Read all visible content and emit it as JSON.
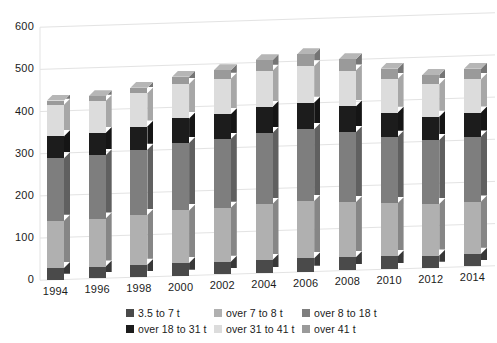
{
  "chart_data": {
    "type": "bar",
    "subtype": "stacked-bar-3d",
    "title": "",
    "subtitle": "",
    "xlabel": "",
    "ylabel": "",
    "ylim": [
      0,
      600
    ],
    "yticks": [
      0,
      100,
      200,
      300,
      400,
      500,
      600
    ],
    "grid": true,
    "legend_position": "bottom",
    "categories": [
      "1994",
      "1996",
      "1998",
      "2000",
      "2002",
      "2004",
      "2006",
      "2008",
      "2010",
      "2012",
      "2014"
    ],
    "series": [
      {
        "name": "3.5 to 7 t",
        "color": "#4a4a4a",
        "values": [
          28,
          28,
          29,
          30,
          30,
          31,
          32,
          31,
          30,
          29,
          30
        ]
      },
      {
        "name": "over 7 to 8 t",
        "color": "#b0b0b0",
        "values": [
          112,
          114,
          118,
          125,
          128,
          133,
          136,
          131,
          126,
          122,
          124
        ]
      },
      {
        "name": "over 8 to 18 t",
        "color": "#7e7e7e",
        "values": [
          148,
          150,
          155,
          160,
          163,
          168,
          170,
          166,
          158,
          152,
          154
        ]
      },
      {
        "name": "over 18 to 31 t",
        "color": "#1c1c1c",
        "values": [
          52,
          53,
          55,
          58,
          59,
          62,
          63,
          61,
          57,
          55,
          57
        ]
      },
      {
        "name": "over 31 to 41 t",
        "color": "#dcdcdc",
        "values": [
          75,
          76,
          79,
          82,
          84,
          86,
          87,
          85,
          80,
          77,
          79
        ]
      },
      {
        "name": "over 41 t",
        "color": "#9a9a9a",
        "values": [
          10,
          11,
          13,
          17,
          20,
          25,
          28,
          27,
          24,
          22,
          25
        ]
      }
    ],
    "totals": [
      425,
      432,
      449,
      472,
      484,
      505,
      516,
      501,
      475,
      457,
      469
    ]
  },
  "axes": {
    "y_tick_labels": [
      "600",
      "500",
      "400",
      "300",
      "200",
      "100",
      "0"
    ],
    "x_tick_labels": [
      "1994",
      "1996",
      "1998",
      "2000",
      "2002",
      "2004",
      "2006",
      "2008",
      "2010",
      "2012",
      "2014"
    ]
  },
  "legend": {
    "items": [
      {
        "label": "3.5 to 7 t",
        "color": "#4a4a4a"
      },
      {
        "label": "over 7 to 8 t",
        "color": "#b0b0b0"
      },
      {
        "label": "over 8 to 18 t",
        "color": "#7e7e7e"
      },
      {
        "label": "over 18 to 31 t",
        "color": "#1c1c1c"
      },
      {
        "label": "over 31 to 41 t",
        "color": "#dcdcdc"
      },
      {
        "label": "over 41 t",
        "color": "#9a9a9a"
      }
    ]
  },
  "style": {
    "background": "#ffffff",
    "gridline_color": "#e3e3e3",
    "text_color": "#1b1b1b"
  }
}
